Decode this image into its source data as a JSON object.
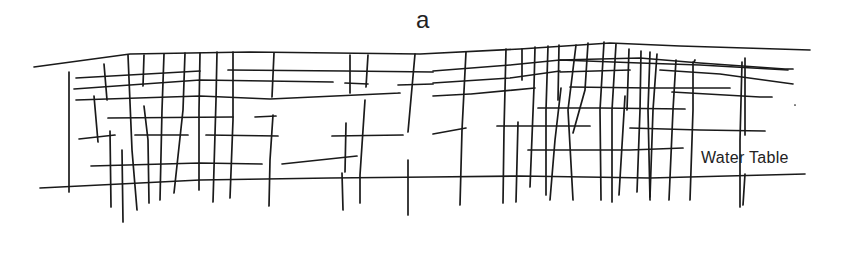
{
  "diagram": {
    "panel_label": "a",
    "water_table_label": "Water Table",
    "stroke_color": "#1a1a1a",
    "ground_surface": [
      [
        34,
        67
      ],
      [
        130,
        54
      ],
      [
        250,
        52
      ],
      [
        420,
        54
      ],
      [
        520,
        49
      ],
      [
        610,
        43
      ],
      [
        680,
        46
      ],
      [
        810,
        50
      ]
    ],
    "water_table": [
      [
        40,
        188
      ],
      [
        200,
        180
      ],
      [
        330,
        178
      ],
      [
        430,
        177
      ],
      [
        520,
        176
      ],
      [
        650,
        178
      ],
      [
        805,
        174
      ]
    ],
    "horizontal_fractures": [
      [
        [
          76,
          78
        ],
        [
          200,
          71
        ]
      ],
      [
        [
          228,
          70
        ],
        [
          345,
          71
        ],
        [
          433,
          72
        ]
      ],
      [
        [
          74,
          89
        ],
        [
          200,
          80
        ],
        [
          333,
          82
        ]
      ],
      [
        [
          345,
          83
        ],
        [
          368,
          84
        ]
      ],
      [
        [
          398,
          85
        ],
        [
          433,
          84
        ]
      ],
      [
        [
          76,
          100
        ],
        [
          200,
          96
        ],
        [
          270,
          99
        ],
        [
          400,
          93
        ],
        [
          398,
          93
        ]
      ],
      [
        [
          108,
          118
        ],
        [
          233,
          117
        ]
      ],
      [
        [
          255,
          117
        ],
        [
          276,
          116
        ]
      ],
      [
        [
          79,
          139
        ],
        [
          115,
          135
        ]
      ],
      [
        [
          135,
          135
        ],
        [
          188,
          135
        ]
      ],
      [
        [
          206,
          135
        ],
        [
          278,
          136
        ]
      ],
      [
        [
          332,
          136
        ],
        [
          403,
          135
        ]
      ],
      [
        [
          91,
          166
        ],
        [
          200,
          163
        ],
        [
          262,
          164
        ]
      ],
      [
        [
          282,
          164
        ],
        [
          357,
          156
        ]
      ],
      [
        [
          433,
          71
        ],
        [
          510,
          65
        ],
        [
          560,
          60
        ],
        [
          640,
          63
        ],
        [
          700,
          65
        ],
        [
          788,
          70
        ]
      ],
      [
        [
          433,
          83
        ],
        [
          510,
          78
        ],
        [
          560,
          71
        ]
      ],
      [
        [
          433,
          96
        ],
        [
          470,
          94
        ]
      ],
      [
        [
          471,
          94
        ],
        [
          535,
          88
        ]
      ],
      [
        [
          560,
          72
        ],
        [
          630,
          70
        ]
      ],
      [
        [
          560,
          60
        ],
        [
          640,
          58
        ],
        [
          700,
          63
        ],
        [
          785,
          69
        ],
        [
          793,
          69
        ]
      ],
      [
        [
          660,
          70
        ],
        [
          720,
          74
        ],
        [
          793,
          84
        ]
      ],
      [
        [
          570,
          87
        ],
        [
          650,
          88
        ],
        [
          730,
          88
        ]
      ],
      [
        [
          672,
          92
        ],
        [
          760,
          97
        ],
        [
          772,
          97
        ]
      ],
      [
        [
          538,
          108
        ],
        [
          600,
          108
        ],
        [
          685,
          109
        ]
      ],
      [
        [
          497,
          126
        ],
        [
          590,
          126
        ]
      ],
      [
        [
          630,
          128
        ],
        [
          700,
          130
        ],
        [
          765,
          131
        ]
      ],
      [
        [
          528,
          150
        ],
        [
          580,
          150
        ],
        [
          630,
          150
        ],
        [
          683,
          148
        ]
      ],
      [
        [
          433,
          134
        ],
        [
          466,
          128
        ]
      ]
    ],
    "vertical_fractures": [
      [
        [
          69,
          72
        ],
        [
          69,
          192
        ]
      ],
      [
        [
          104,
          64
        ],
        [
          107,
          100
        ]
      ],
      [
        [
          94,
          96
        ],
        [
          98,
          142
        ]
      ],
      [
        [
          110,
          131
        ],
        [
          111,
          207
        ]
      ],
      [
        [
          122,
          150
        ],
        [
          123,
          222
        ]
      ],
      [
        [
          128,
          55
        ],
        [
          132,
          150
        ],
        [
          137,
          210
        ]
      ],
      [
        [
          144,
          55
        ],
        [
          143,
          86
        ]
      ],
      [
        [
          144,
          106
        ],
        [
          148,
          140
        ],
        [
          149,
          203
        ]
      ],
      [
        [
          164,
          54
        ],
        [
          162,
          110
        ],
        [
          160,
          200
        ]
      ],
      [
        [
          185,
          53
        ],
        [
          183,
          110
        ],
        [
          174,
          193
        ]
      ],
      [
        [
          200,
          53
        ],
        [
          199,
          110
        ],
        [
          199,
          190
        ]
      ],
      [
        [
          217,
          52
        ],
        [
          216,
          100
        ],
        [
          213,
          202
        ]
      ],
      [
        [
          233,
          52
        ],
        [
          233,
          120
        ],
        [
          230,
          198
        ]
      ],
      [
        [
          274,
          53
        ],
        [
          272,
          97
        ]
      ],
      [
        [
          273,
          115
        ],
        [
          270,
          160
        ],
        [
          269,
          206
        ]
      ],
      [
        [
          350,
          55
        ],
        [
          350,
          93
        ]
      ],
      [
        [
          368,
          55
        ],
        [
          366,
          87
        ]
      ],
      [
        [
          365,
          100
        ],
        [
          360,
          175
        ],
        [
          360,
          203
        ]
      ],
      [
        [
          346,
          123
        ],
        [
          345,
          172
        ]
      ],
      [
        [
          342,
          173
        ],
        [
          343,
          210
        ]
      ],
      [
        [
          415,
          54
        ],
        [
          408,
          132
        ]
      ],
      [
        [
          408,
          160
        ],
        [
          408,
          215
        ]
      ],
      [
        [
          466,
          52
        ],
        [
          462,
          130
        ],
        [
          460,
          205
        ]
      ],
      [
        [
          506,
          49
        ],
        [
          504,
          130
        ],
        [
          503,
          203
        ]
      ],
      [
        [
          522,
          49
        ],
        [
          522,
          80
        ]
      ],
      [
        [
          518,
          122
        ],
        [
          516,
          202
        ]
      ],
      [
        [
          535,
          47
        ],
        [
          534,
          87
        ],
        [
          530,
          187
        ]
      ],
      [
        [
          548,
          46
        ],
        [
          546,
          110
        ],
        [
          546,
          195
        ]
      ],
      [
        [
          559,
          45
        ],
        [
          558,
          100
        ]
      ],
      [
        [
          561,
          88
        ],
        [
          555,
          140
        ],
        [
          550,
          200
        ]
      ],
      [
        [
          576,
          45
        ],
        [
          568,
          110
        ],
        [
          573,
          200
        ]
      ],
      [
        [
          588,
          43
        ],
        [
          585,
          90
        ],
        [
          573,
          133
        ]
      ],
      [
        [
          604,
          42
        ],
        [
          600,
          110
        ],
        [
          601,
          200
        ]
      ],
      [
        [
          616,
          44
        ],
        [
          612,
          110
        ],
        [
          612,
          202
        ]
      ],
      [
        [
          629,
          49
        ],
        [
          627,
          110
        ]
      ],
      [
        [
          625,
          96
        ],
        [
          619,
          195
        ]
      ],
      [
        [
          641,
          51
        ],
        [
          640,
          110
        ],
        [
          637,
          192
        ]
      ],
      [
        [
          650,
          52
        ],
        [
          648,
          110
        ],
        [
          650,
          200
        ]
      ],
      [
        [
          657,
          54
        ],
        [
          653,
          110
        ],
        [
          650,
          197
        ]
      ],
      [
        [
          676,
          60
        ],
        [
          673,
          110
        ],
        [
          669,
          200
        ]
      ],
      [
        [
          693,
          62
        ],
        [
          693,
          110
        ],
        [
          690,
          200
        ]
      ],
      [
        [
          694,
          62
        ],
        [
          695,
          60
        ]
      ],
      [
        [
          742,
          62
        ],
        [
          740,
          140
        ],
        [
          740,
          207
        ]
      ],
      [
        [
          745,
          174
        ],
        [
          743,
          205
        ]
      ],
      [
        [
          745,
          58
        ],
        [
          745,
          135
        ]
      ],
      [
        [
          795,
          105
        ],
        [
          795,
          105
        ]
      ]
    ]
  }
}
